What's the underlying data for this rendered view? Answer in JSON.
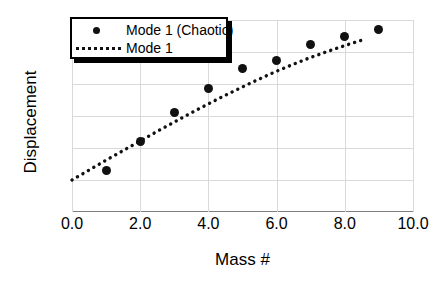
{
  "chart_data": {
    "type": "scatter",
    "title": "",
    "xlabel": "Mass #",
    "ylabel": "Displacement",
    "xlim": [
      0.0,
      10.0
    ],
    "ylim": [
      -0.1,
      0.5
    ],
    "xticks": [
      "0.0",
      "2.0",
      "4.0",
      "6.0",
      "8.0",
      "10.0"
    ],
    "xtick_values": [
      0.0,
      2.0,
      4.0,
      6.0,
      8.0,
      10.0
    ],
    "yticks": [
      "0.5",
      "0.4",
      "0.3",
      "0.2",
      "0.1",
      "0.0",
      "-0.1"
    ],
    "ytick_values": [
      0.5,
      0.4,
      0.3,
      0.2,
      0.1,
      0.0,
      -0.1
    ],
    "grid": true,
    "legend_position": "top-left",
    "series": [
      {
        "name": "Mode 1 (Chaotic)",
        "style": "markers",
        "marker": "filled-circle",
        "color": "#111111",
        "x": [
          1.0,
          2.0,
          3.0,
          4.0,
          5.0,
          6.0,
          7.0,
          8.0,
          9.0
        ],
        "values": [
          0.03,
          0.12,
          0.21,
          0.285,
          0.35,
          0.372,
          0.422,
          0.448,
          0.47
        ]
      },
      {
        "name": "Mode 1",
        "style": "dotted-line",
        "color": "#111111",
        "x": [
          0.0,
          0.5,
          1.0,
          1.5,
          2.0,
          2.5,
          3.0,
          3.5,
          4.0,
          4.5,
          5.0,
          5.5,
          6.0,
          6.5,
          7.0,
          7.5,
          8.0,
          8.5
        ],
        "values": [
          0.0,
          0.031,
          0.062,
          0.092,
          0.122,
          0.152,
          0.181,
          0.21,
          0.238,
          0.265,
          0.291,
          0.316,
          0.34,
          0.362,
          0.383,
          0.402,
          0.42,
          0.437
        ]
      }
    ]
  },
  "legend": {
    "entries": [
      {
        "label": "Mode 1 (Chaotic)",
        "key": "marker-dot-key"
      },
      {
        "label": "Mode 1",
        "key": "dotted-line-key"
      }
    ]
  }
}
